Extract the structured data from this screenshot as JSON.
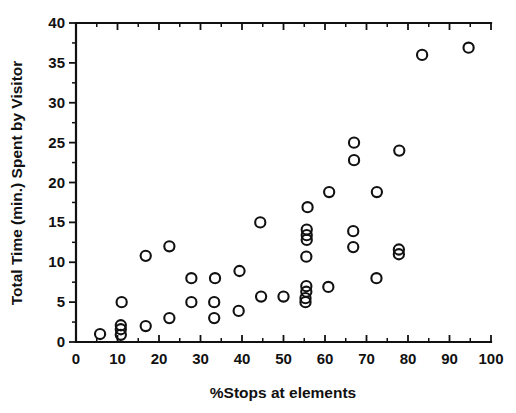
{
  "chart_data": {
    "type": "scatter",
    "title": "",
    "xlabel": "%Stops at elements",
    "ylabel": "Total Time (min.) Spent by Visitor",
    "xlim": [
      0,
      100
    ],
    "ylim": [
      0,
      40
    ],
    "xticks": [
      0,
      10,
      20,
      30,
      40,
      50,
      60,
      70,
      80,
      90,
      100
    ],
    "yticks": [
      0,
      5,
      10,
      15,
      20,
      25,
      30,
      35,
      40
    ],
    "xtick_labels": [
      "0",
      "10",
      "20",
      "30",
      "40",
      "50",
      "60",
      "70",
      "80",
      "90",
      "100"
    ],
    "ytick_labels": [
      "0",
      "5",
      "10",
      "15",
      "20",
      "25",
      "30",
      "35",
      "40"
    ],
    "grid": false,
    "legend": null,
    "marker": "open-circle",
    "marker_color": "#111111",
    "points": [
      [
        5.8,
        1.0
      ],
      [
        10.8,
        0.9
      ],
      [
        10.8,
        1.6
      ],
      [
        10.8,
        2.1
      ],
      [
        11.0,
        5.0
      ],
      [
        16.8,
        2.0
      ],
      [
        16.8,
        10.8
      ],
      [
        22.5,
        3.0
      ],
      [
        22.5,
        12.0
      ],
      [
        27.8,
        5.0
      ],
      [
        27.8,
        8.0
      ],
      [
        33.3,
        3.0
      ],
      [
        33.3,
        5.0
      ],
      [
        33.5,
        8.0
      ],
      [
        39.2,
        3.9
      ],
      [
        39.4,
        8.9
      ],
      [
        44.4,
        15.0
      ],
      [
        44.6,
        5.7
      ],
      [
        50.0,
        5.7
      ],
      [
        55.3,
        5.0
      ],
      [
        55.3,
        5.5
      ],
      [
        55.5,
        6.3
      ],
      [
        55.5,
        7.0
      ],
      [
        55.5,
        10.7
      ],
      [
        55.6,
        12.8
      ],
      [
        55.6,
        13.4
      ],
      [
        55.6,
        14.1
      ],
      [
        55.8,
        16.9
      ],
      [
        60.8,
        6.9
      ],
      [
        61.0,
        18.8
      ],
      [
        66.8,
        11.9
      ],
      [
        66.8,
        13.9
      ],
      [
        67.0,
        22.8
      ],
      [
        67.0,
        25.0
      ],
      [
        72.4,
        8.0
      ],
      [
        72.5,
        18.8
      ],
      [
        77.8,
        11.0
      ],
      [
        77.8,
        11.6
      ],
      [
        77.9,
        24.0
      ],
      [
        83.4,
        36.0
      ],
      [
        94.6,
        36.9
      ]
    ]
  }
}
